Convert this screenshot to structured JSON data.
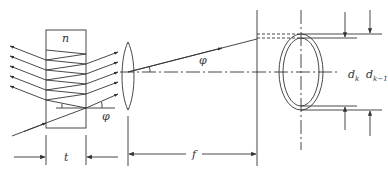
{
  "diagram": {
    "labels": {
      "refractive_index": "n",
      "plate_thickness": "t",
      "angle_plate": "φ",
      "angle_lens": "φ",
      "focal_length": "f",
      "ring_k": "d",
      "ring_k_sub": "k",
      "ring_k1": "d",
      "ring_k1_sub": "k−1"
    },
    "colors": {
      "stroke": "#333333",
      "background": "#ffffff"
    },
    "elements": [
      "plane-parallel plate",
      "incident ray",
      "multiply reflected rays",
      "transmitted rays",
      "converging lens",
      "optical axis",
      "focal plane",
      "interference rings"
    ]
  }
}
